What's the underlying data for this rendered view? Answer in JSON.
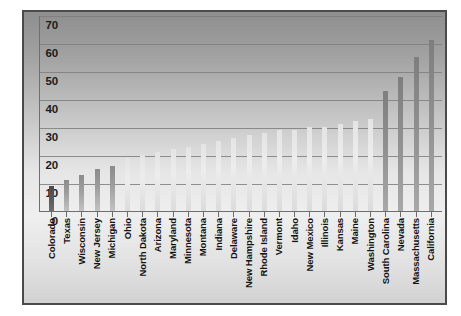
{
  "chart_data": {
    "type": "bar",
    "title": "",
    "subtitle": "",
    "xlabel": "",
    "ylabel": "",
    "ylim": [
      0,
      70
    ],
    "yticks": [
      0,
      10,
      20,
      30,
      40,
      50,
      60,
      70
    ],
    "grid": true,
    "legend": "none",
    "orientation": "vertical",
    "categories": [
      "Colorado",
      "Texas",
      "Wisconsin",
      "New Jersey",
      "Michigan",
      "Ohio",
      "North Dakota",
      "Arizona",
      "Maryland",
      "Minnesota",
      "Montana",
      "Indiana",
      "Delaware",
      "New Hampshire",
      "Rhode Island",
      "Vermont",
      "Idaho",
      "New Mexico",
      "Illinois",
      "Kansas",
      "Maine",
      "Washington",
      "South Carolina",
      "Nevada",
      "Massachusetts",
      "California"
    ],
    "values": [
      9,
      11,
      13,
      15,
      16,
      19,
      20,
      21,
      22,
      23,
      24,
      25,
      26,
      27,
      28,
      29,
      29,
      30,
      30,
      31,
      32,
      33,
      43,
      48,
      55,
      61
    ],
    "bar_tones": [
      "dark",
      "mid",
      "mid",
      "mid",
      "mid",
      "light",
      "light",
      "light",
      "light",
      "light",
      "light",
      "light",
      "light",
      "light",
      "light",
      "light",
      "light",
      "light",
      "light",
      "light",
      "light",
      "light",
      "steel",
      "steel",
      "steel",
      "steel"
    ]
  },
  "colors": {
    "frame_border": "#4a4a4a",
    "gridline": "#7e7e7e",
    "axis": "#6f6f6f",
    "tick_text": "#1b1b1b",
    "category_text": "#131313",
    "page_background": "#ffffff",
    "bar_dark": "#4a4a4a",
    "bar_mid": "#8c8c8c",
    "bar_light": "#e4e4e4",
    "bar_steel": "#7e7e7e"
  }
}
